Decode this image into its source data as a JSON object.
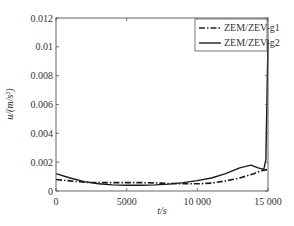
{
  "chart_data": {
    "type": "line",
    "title": "",
    "xlabel": "t/s",
    "ylabel": "u/(m/s²)",
    "xlim": [
      0,
      15000
    ],
    "ylim": [
      0,
      0.012
    ],
    "x_ticks": [
      0,
      5000,
      10000,
      15000
    ],
    "x_tick_labels": [
      "0",
      "5000",
      "10 000",
      "15 000"
    ],
    "y_ticks": [
      0,
      0.002,
      0.004,
      0.006,
      0.008,
      0.01,
      0.012
    ],
    "y_tick_labels": [
      "0",
      "0.002",
      "0.004",
      "0.006",
      "0.008",
      "0.01",
      "0.012"
    ],
    "grid": false,
    "legend_position": "upper right",
    "series": [
      {
        "name": "ZEM/ZEV-g1",
        "style": "dash-dot",
        "x": [
          0,
          1000,
          2000,
          3000,
          4000,
          5000,
          6000,
          7000,
          8000,
          9000,
          10000,
          11000,
          12000,
          13000,
          14000,
          14500,
          15000
        ],
        "values": [
          0.0008,
          0.0007,
          0.0006,
          0.00058,
          0.00058,
          0.00058,
          0.00058,
          0.00056,
          0.00052,
          0.0005,
          0.0005,
          0.00055,
          0.0007,
          0.0009,
          0.0012,
          0.0014,
          0.0015
        ]
      },
      {
        "name": "ZEM/ZEV-g2",
        "style": "solid",
        "x": [
          0,
          1000,
          2000,
          3000,
          4000,
          5000,
          6000,
          7000,
          8000,
          9000,
          10000,
          11000,
          12000,
          13000,
          13800,
          14300,
          14700,
          14850,
          15000
        ],
        "values": [
          0.0012,
          0.0009,
          0.00065,
          0.0005,
          0.00042,
          0.0004,
          0.0004,
          0.00042,
          0.00048,
          0.00058,
          0.00072,
          0.0009,
          0.0012,
          0.0016,
          0.0018,
          0.0016,
          0.0015,
          0.0022,
          0.0105
        ]
      }
    ]
  }
}
